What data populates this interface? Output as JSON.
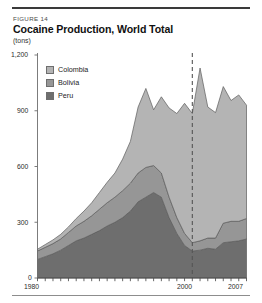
{
  "figure": {
    "number_label": "FIGURE 14",
    "title": "Cocaine Production, World Total",
    "units": "(tons)"
  },
  "legend": {
    "position": "inside-top-left",
    "items": [
      {
        "label": "Colombia",
        "color": "#b4b4b4"
      },
      {
        "label": "Bolivia",
        "color": "#969696"
      },
      {
        "label": "Peru",
        "color": "#6e6e6e"
      }
    ]
  },
  "axes": {
    "y_ticks": [
      "0",
      "300",
      "600",
      "900",
      "1,200"
    ],
    "x_ticks": [
      "1980",
      "2000",
      "2007"
    ]
  },
  "annotations": {
    "marker_year": 2000,
    "marker_style": "dashed-vertical"
  },
  "chart_data": {
    "type": "area",
    "stacked": true,
    "title": "Cocaine Production, World Total",
    "subtitle": "FIGURE 14",
    "xlabel": "",
    "ylabel": "(tons)",
    "ylim": [
      0,
      1200
    ],
    "xlim": [
      1980,
      2007
    ],
    "grid": false,
    "legend_position": "inside-top-left",
    "ytick_values": [
      0,
      300,
      600,
      900,
      1200
    ],
    "xtick_values": [
      1980,
      2000,
      2007
    ],
    "x": [
      1980,
      1981,
      1982,
      1983,
      1984,
      1985,
      1986,
      1987,
      1988,
      1989,
      1990,
      1991,
      1992,
      1993,
      1994,
      1995,
      1996,
      1997,
      1998,
      1999,
      2000,
      2001,
      2002,
      2003,
      2004,
      2005,
      2006,
      2007
    ],
    "series": [
      {
        "name": "Peru",
        "color": "#6e6e6e",
        "values": [
          100,
          115,
          130,
          150,
          175,
          200,
          215,
          235,
          255,
          280,
          300,
          325,
          360,
          410,
          435,
          460,
          435,
          325,
          240,
          175,
          145,
          150,
          160,
          155,
          190,
          195,
          200,
          210
        ]
      },
      {
        "name": "Bolivia",
        "color": "#969696",
        "values": [
          45,
          50,
          55,
          60,
          70,
          80,
          90,
          100,
          115,
          125,
          135,
          145,
          150,
          155,
          160,
          145,
          130,
          110,
          85,
          65,
          45,
          50,
          55,
          60,
          105,
          110,
          105,
          110
        ]
      },
      {
        "name": "Colombia",
        "color": "#b4b4b4",
        "values": [
          10,
          15,
          20,
          25,
          30,
          40,
          55,
          70,
          90,
          110,
          130,
          170,
          225,
          355,
          425,
          300,
          410,
          480,
          560,
          700,
          695,
          930,
          705,
          675,
          735,
          650,
          680,
          610
        ]
      }
    ],
    "totals": [
      155,
      180,
      205,
      235,
      275,
      320,
      360,
      405,
      460,
      515,
      565,
      640,
      735,
      920,
      1020,
      905,
      975,
      915,
      885,
      940,
      885,
      1130,
      920,
      890,
      1030,
      955,
      985,
      930
    ]
  }
}
